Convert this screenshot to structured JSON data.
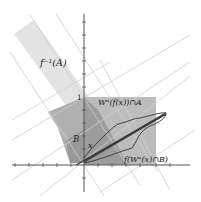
{
  "diagram": {
    "type": "dynamical-systems-figure",
    "labels": {
      "preimage_region": "f⁻¹(A)",
      "unstable_intersection_A": "Wᵘ(f(x))∩A",
      "image_unstable_B": "f(Wᵘ(x)∩B)",
      "region_B": "B",
      "point_x": "x",
      "tick_one": "1"
    },
    "colors": {
      "preimage_band": "#e2e2e2",
      "region_A": "#b9b9b9",
      "region_B": "#a4a4a4",
      "overlap": "#8f8f8f",
      "grid_lines": "#cfcfcf",
      "axes": "#555555",
      "curve": "#333333"
    }
  }
}
